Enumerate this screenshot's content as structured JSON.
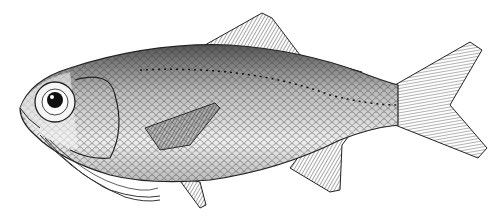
{
  "image": {
    "subject": "fish illustration",
    "style": "black-and-white engraving",
    "width": 503,
    "height": 223,
    "colors": {
      "background": "#ffffff",
      "ink": "#1a1a1a",
      "shade": "#555555",
      "light": "#e8e8e8"
    }
  }
}
